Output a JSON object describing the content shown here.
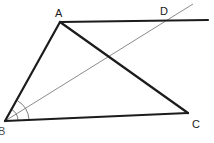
{
  "figure": {
    "width": 214,
    "height": 143,
    "background": "#ffffff",
    "stroke_thick": "#1c1c1c",
    "stroke_thin": "#8c8c8c",
    "label_color": "#1a1a1a"
  },
  "points": {
    "A": {
      "label": "A",
      "x": 60,
      "y": 22
    },
    "B": {
      "label": "B",
      "x": 5,
      "y": 121
    },
    "C": {
      "label": "C",
      "x": 188,
      "y": 113
    },
    "D": {
      "label": "D",
      "x": 165,
      "y": 20
    }
  },
  "segments": [
    {
      "name": "segment-BA",
      "from": "B",
      "to": "A",
      "style": "thick",
      "width": 2.2
    },
    {
      "name": "segment-AD-extended",
      "from": "A",
      "to": "line-end-right",
      "style": "thick",
      "width": 2.2
    },
    {
      "name": "segment-AC",
      "from": "A",
      "to": "C",
      "style": "thick",
      "width": 2.2
    },
    {
      "name": "segment-BC",
      "from": "B",
      "to": "C",
      "style": "thick",
      "width": 2.2
    },
    {
      "name": "segment-BD-extended",
      "from": "B",
      "to": "ray-end-upper-right",
      "style": "thin",
      "width": 1.0
    }
  ],
  "extensions": {
    "top_line_right_end": {
      "x": 208,
      "y": 20
    },
    "bd_ray_end": {
      "x": 193,
      "y": 4
    }
  },
  "angle_marks": [
    {
      "name": "angle-arc-inner",
      "vertex": "B",
      "radius": 13,
      "style": "thin"
    },
    {
      "name": "angle-arc-outer",
      "vertex": "B",
      "radius": 24,
      "style": "thin"
    }
  ]
}
